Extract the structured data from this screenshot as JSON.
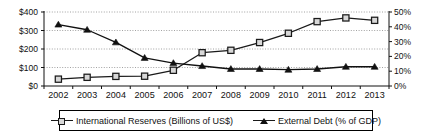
{
  "chart_data": {
    "type": "line",
    "title": "",
    "xlabel": "",
    "ylabel": "",
    "grid": true,
    "legend_position": "bottom",
    "categories": [
      "2002",
      "2003",
      "2004",
      "2005",
      "2006",
      "2007",
      "2008",
      "2009",
      "2010",
      "2011",
      "2012",
      "2013"
    ],
    "axes": {
      "left": {
        "label": "",
        "ticks": [
          "$400",
          "$300",
          "$200",
          "$100",
          "$0"
        ],
        "tick_values": [
          400,
          300,
          200,
          100,
          0
        ],
        "ylim": [
          0,
          400
        ],
        "unit": "Billions of US$"
      },
      "right": {
        "label": "",
        "ticks": [
          "50%",
          "40%",
          "30%",
          "20%",
          "10%",
          "0%"
        ],
        "tick_values": [
          50,
          40,
          30,
          20,
          10,
          0
        ],
        "ylim": [
          0,
          50
        ],
        "unit": "% of GDP"
      }
    },
    "series": [
      {
        "name": "International Reserves (Billions of US$)",
        "axis": "left",
        "marker": "open-square",
        "color": "#1a1a1a",
        "values": [
          37,
          47,
          52,
          53,
          85,
          180,
          193,
          235,
          285,
          348,
          368,
          355
        ]
      },
      {
        "name": "External Debt (% of GDP)",
        "axis": "right",
        "marker": "filled-triangle",
        "color": "#111111",
        "values": [
          41.5,
          38.0,
          29.5,
          19.0,
          15.5,
          13.5,
          11.5,
          11.5,
          11.0,
          11.5,
          13.0,
          13.0
        ]
      }
    ]
  },
  "legend": {
    "items": [
      {
        "label": "International Reserves (Billions of US$)",
        "marker": "open-square"
      },
      {
        "label": "External Debt (% of GDP)",
        "marker": "filled-triangle"
      }
    ]
  }
}
